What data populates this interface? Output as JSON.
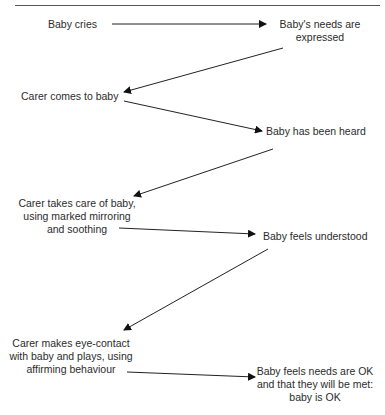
{
  "diagram": {
    "nodes": [
      {
        "id": "baby-cries",
        "lines": [
          "Baby cries"
        ]
      },
      {
        "id": "needs-expressed",
        "lines": [
          "Baby's needs are",
          "expressed"
        ]
      },
      {
        "id": "carer-comes",
        "lines": [
          "Carer comes to baby"
        ]
      },
      {
        "id": "baby-heard",
        "lines": [
          "Baby has been heard"
        ]
      },
      {
        "id": "carer-takes-care",
        "lines": [
          "Carer takes care of baby,",
          "using marked mirroring",
          "and soothing"
        ]
      },
      {
        "id": "baby-understood",
        "lines": [
          "Baby feels understood"
        ]
      },
      {
        "id": "carer-eye-contact",
        "lines": [
          "Carer makes eye-contact",
          "with baby and plays, using",
          "affirming behaviour"
        ]
      },
      {
        "id": "baby-ok",
        "lines": [
          "Baby feels needs are OK",
          "and that they will be met:",
          "baby is OK"
        ]
      }
    ],
    "edges": [
      {
        "from": "baby-cries",
        "to": "needs-expressed"
      },
      {
        "from": "needs-expressed",
        "to": "carer-comes"
      },
      {
        "from": "carer-comes",
        "to": "baby-heard"
      },
      {
        "from": "baby-heard",
        "to": "carer-takes-care"
      },
      {
        "from": "carer-takes-care",
        "to": "baby-understood"
      },
      {
        "from": "baby-understood",
        "to": "carer-eye-contact"
      },
      {
        "from": "carer-eye-contact",
        "to": "baby-ok"
      }
    ]
  }
}
